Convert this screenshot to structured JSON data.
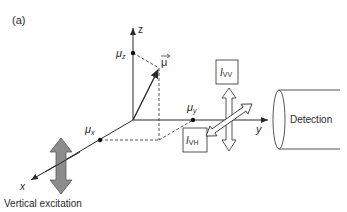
{
  "figure": {
    "panel_label": "(a)",
    "axes": {
      "z_label": "z",
      "y_label": "y",
      "x_label": "x"
    },
    "dipole": {
      "vector_label": "μ",
      "components": {
        "x": {
          "symbol": "μ",
          "sub": "x"
        },
        "y": {
          "symbol": "μ",
          "sub": "y"
        },
        "z": {
          "symbol": "μ",
          "sub": "z"
        }
      }
    },
    "intensities": {
      "vv": {
        "symbol": "I",
        "sub": "VV"
      },
      "vh": {
        "symbol": "I",
        "sub": "VH"
      }
    },
    "detector_label": "Detection",
    "excitation_label": "Vertical excitation",
    "colors": {
      "line": "#2a2a2a",
      "excitation_arrow_fill": "#8c8c8c",
      "excitation_arrow_stroke": "#5a5a5a"
    }
  }
}
